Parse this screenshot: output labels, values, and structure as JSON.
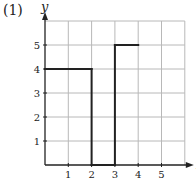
{
  "problem_label": "(1)",
  "chart_data": {
    "type": "line",
    "title": "",
    "xlabel": "x",
    "ylabel": "y",
    "xlim": [
      0,
      6
    ],
    "ylim": [
      0,
      6
    ],
    "x_ticks": [
      1,
      2,
      3,
      4,
      5
    ],
    "y_ticks": [
      1,
      2,
      3,
      4,
      5
    ],
    "grid": true,
    "legend": "none",
    "series": [
      {
        "name": "step function",
        "segments": [
          {
            "x": [
              0,
              2
            ],
            "y": [
              4,
              4
            ]
          },
          {
            "x": [
              2,
              2
            ],
            "y": [
              4,
              0
            ]
          },
          {
            "x": [
              2,
              3
            ],
            "y": [
              0,
              0
            ]
          },
          {
            "x": [
              3,
              3
            ],
            "y": [
              0,
              5
            ]
          },
          {
            "x": [
              3,
              4
            ],
            "y": [
              5,
              5
            ]
          }
        ]
      }
    ]
  },
  "colors": {
    "grid": "#b8b8b8",
    "axis": "#222222",
    "line": "#222222"
  }
}
